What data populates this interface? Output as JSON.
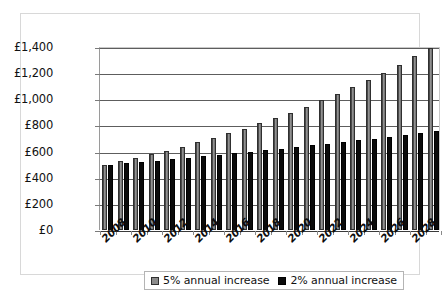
{
  "chart_data": {
    "type": "bar",
    "title": "",
    "subtitle": "",
    "xlabel": "",
    "ylabel": "",
    "grid": true,
    "legend_position": "bottom",
    "ylim": [
      0,
      1400
    ],
    "ytick_step": 200,
    "ytick_labels": [
      "£0",
      "£200",
      "£400",
      "£600",
      "£800",
      "£1,000",
      "£1,200",
      "£1,400"
    ],
    "ytick_values": [
      0,
      200,
      400,
      600,
      800,
      1000,
      1200,
      1400
    ],
    "categories": [
      "2008",
      "2009",
      "2010",
      "2011",
      "2012",
      "2013",
      "2014",
      "2015",
      "2016",
      "2017",
      "2018",
      "2019",
      "2020",
      "2021",
      "2022",
      "2023",
      "2024",
      "2025",
      "2026",
      "2027",
      "2028",
      "2029"
    ],
    "xtick_labels_shown": [
      "2008",
      "",
      "2010",
      "",
      "2012",
      "",
      "2014",
      "",
      "2016",
      "",
      "2018",
      "",
      "2020",
      "",
      "2022",
      "",
      "2024",
      "",
      "2026",
      "",
      "2028",
      ""
    ],
    "series": [
      {
        "name": "5% annual increase",
        "color": "#8a8a8a",
        "values": [
          500,
          525,
          551,
          579,
          608,
          638,
          670,
          704,
          739,
          776,
          815,
          856,
          898,
          943,
          991,
          1040,
          1092,
          1147,
          1204,
          1264,
          1328,
          1394
        ]
      },
      {
        "name": "2% annual increase",
        "color": "#0b0b0b",
        "values": [
          500,
          510,
          520,
          531,
          541,
          552,
          563,
          574,
          586,
          598,
          610,
          622,
          634,
          647,
          660,
          673,
          686,
          700,
          714,
          728,
          743,
          758
        ]
      }
    ]
  },
  "legend": {
    "entries": [
      {
        "label": "5% annual increase",
        "swatch": "series-5-swatch"
      },
      {
        "label": "2% annual increase",
        "swatch": "series-2-swatch"
      }
    ]
  }
}
